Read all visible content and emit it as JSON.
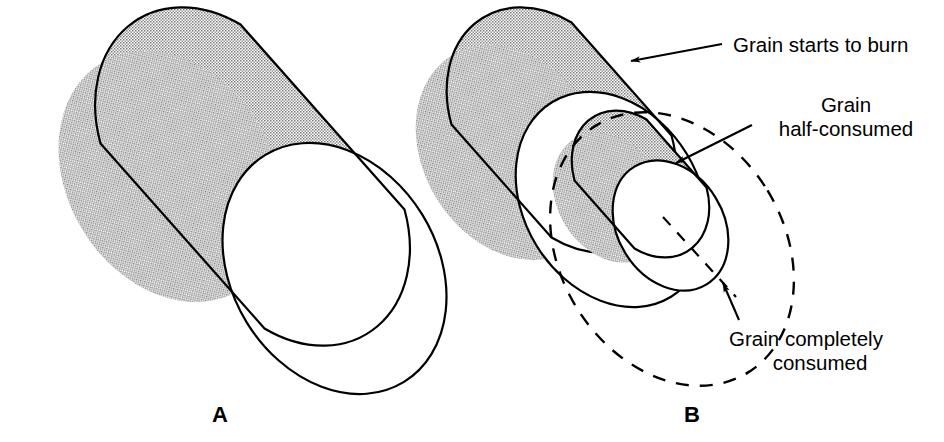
{
  "figure": {
    "type": "technical-line-diagram",
    "background_color": "#ffffff",
    "ink_color": "#000000",
    "stipple_fill_color": "#b4b4b4"
  },
  "panels": [
    {
      "id": "A",
      "caption": "A",
      "description": "unburned cylindrical grain"
    },
    {
      "id": "B",
      "caption": "B",
      "description": "grain at successive burn stages"
    }
  ],
  "callouts": [
    {
      "id": "grain-starts-to-burn",
      "lines": [
        "Grain starts to burn"
      ],
      "line1": "Grain starts to burn",
      "align": "left"
    },
    {
      "id": "grain-half-consumed",
      "lines": [
        "Grain",
        "half-consumed"
      ],
      "line1": "Grain",
      "line2": "half-consumed",
      "align": "center"
    },
    {
      "id": "grain-completely-consumed",
      "lines": [
        "Grain completely",
        "consumed"
      ],
      "line1": "Grain completely",
      "line2": "consumed",
      "align": "center"
    }
  ]
}
